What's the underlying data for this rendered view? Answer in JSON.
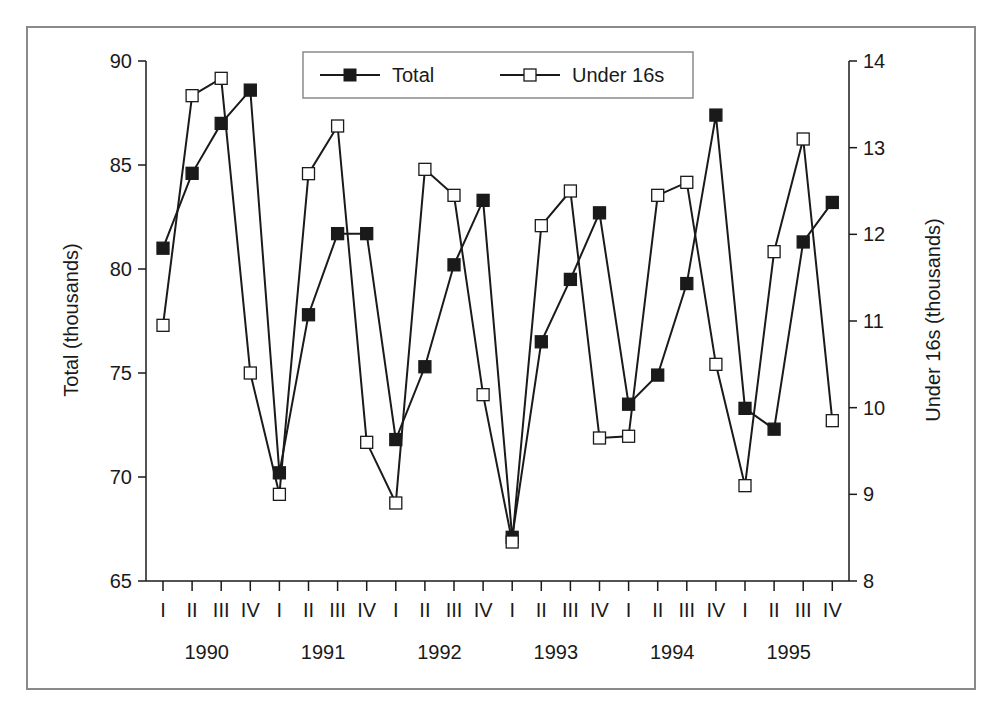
{
  "chart_data": {
    "type": "line",
    "title": "",
    "xlabel": "",
    "ylabel_left": "Total (thousands)",
    "ylabel_right": "Under 16s (thousands)",
    "ylim_left": [
      65,
      90
    ],
    "ylim_right": [
      8,
      14
    ],
    "yticks_left": [
      "65",
      "70",
      "75",
      "80",
      "85",
      "90"
    ],
    "yticks_right": [
      "8",
      "9",
      "10",
      "11",
      "12",
      "13",
      "14"
    ],
    "quarter_labels": [
      "I",
      "II",
      "III",
      "IV",
      "I",
      "II",
      "III",
      "IV",
      "I",
      "II",
      "III",
      "IV",
      "I",
      "II",
      "III",
      "IV",
      "I",
      "II",
      "III",
      "IV",
      "I",
      "II",
      "III",
      "IV"
    ],
    "year_labels": [
      "1990",
      "1991",
      "1992",
      "1993",
      "1994",
      "1995"
    ],
    "categories": [
      "1990 I",
      "1990 II",
      "1990 III",
      "1990 IV",
      "1991 I",
      "1991 II",
      "1991 III",
      "1991 IV",
      "1992 I",
      "1992 II",
      "1992 III",
      "1992 IV",
      "1993 I",
      "1993 II",
      "1993 III",
      "1993 IV",
      "1994 I",
      "1994 II",
      "1994 III",
      "1994 IV",
      "1995 I",
      "1995 II",
      "1995 III",
      "1995 IV"
    ],
    "grid": false,
    "legend_position": "top-center",
    "series": [
      {
        "name": "Total",
        "axis": "left",
        "marker": "filled-square",
        "values": [
          81.0,
          84.6,
          87.0,
          88.6,
          70.2,
          77.8,
          81.7,
          81.7,
          71.8,
          75.3,
          80.2,
          83.3,
          67.1,
          76.5,
          79.5,
          82.7,
          73.5,
          74.9,
          79.3,
          87.4,
          73.3,
          72.3,
          81.3,
          83.2
        ]
      },
      {
        "name": "Under 16s",
        "axis": "right",
        "marker": "open-square",
        "values": [
          10.95,
          13.6,
          13.8,
          10.4,
          9.0,
          12.7,
          13.25,
          9.6,
          8.9,
          12.75,
          12.45,
          10.15,
          8.45,
          12.1,
          12.5,
          9.65,
          9.67,
          12.45,
          12.6,
          10.5,
          9.1,
          11.8,
          13.1,
          9.85
        ]
      }
    ]
  },
  "legend": {
    "items": [
      {
        "label": "Total"
      },
      {
        "label": "Under 16s"
      }
    ]
  },
  "colors": {
    "line": "#1a1a1a",
    "frame": "#8a8a8a",
    "marker_fill_total": "#1a1a1a",
    "marker_fill_under16": "#ffffff"
  }
}
